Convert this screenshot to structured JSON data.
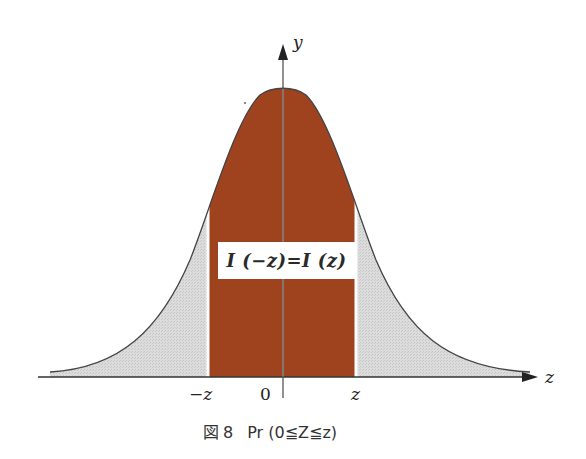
{
  "figure": {
    "caption_prefix": "図",
    "caption_number": "8",
    "caption_text": "Pr (0≦Z≦z)",
    "equation_label": "I (−z)=I (z)",
    "axes": {
      "x_label": "z",
      "y_label": "y",
      "ticks": [
        {
          "label": "−z",
          "position": "-z"
        },
        {
          "label": "0",
          "position": "0"
        },
        {
          "label": "z",
          "position": "z"
        }
      ]
    },
    "regions": [
      {
        "name": "central",
        "range": "[-z, z]",
        "color": "#a2451f"
      },
      {
        "name": "left-tail",
        "range": "(-inf, -z)",
        "color": "#d6d6d6"
      },
      {
        "name": "right-tail",
        "range": "(z, inf)",
        "color": "#d6d6d6"
      }
    ],
    "colors": {
      "central_fill": "#a2451f",
      "tail_fill": "#d6d6d6",
      "curve": "#444444",
      "axis": "#333333",
      "divider": "#ffffff"
    }
  }
}
